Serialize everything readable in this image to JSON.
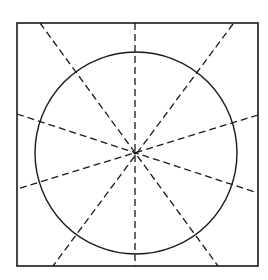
{
  "diagram": {
    "type": "geometric-construction",
    "colors": {
      "background": "#ffffff",
      "stroke": "#1a1a1a"
    },
    "square": {
      "x1": 17,
      "y1": 23,
      "x2": 258,
      "y2": 266
    },
    "circle": {
      "cx": 136,
      "cy": 153,
      "r": 101
    },
    "center": {
      "x": 135,
      "y": 153
    },
    "dashed_lines": [
      {
        "name": "vertical",
        "x1": 135,
        "y1": 23,
        "x2": 135,
        "y2": 266
      },
      {
        "name": "steep-left",
        "x1": 40,
        "y1": 23,
        "x2": 218,
        "y2": 266
      },
      {
        "name": "steep-right",
        "x1": 233,
        "y1": 24,
        "x2": 53,
        "y2": 266
      },
      {
        "name": "shallow-left",
        "x1": 17,
        "y1": 114,
        "x2": 258,
        "y2": 193
      },
      {
        "name": "shallow-right",
        "x1": 258,
        "y1": 115,
        "x2": 17,
        "y2": 189
      }
    ]
  }
}
